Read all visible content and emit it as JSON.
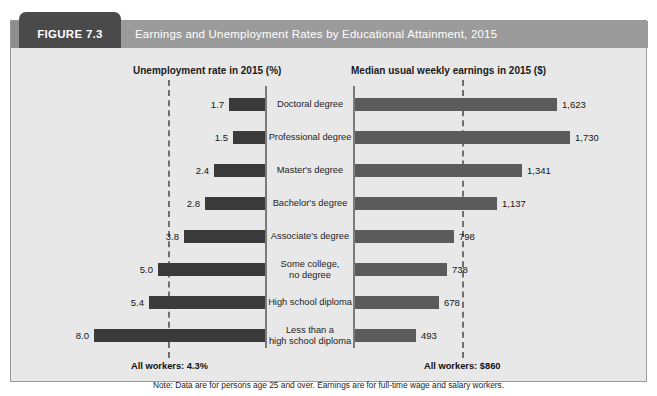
{
  "figure": {
    "tab_label": "FIGURE 7.3",
    "title": "Earnings and Unemployment Rates by Educational Attainment, 2015",
    "note": "Note: Data are for persons age 25 and over. Earnings are for full-time wage and salary workers.",
    "all_workers_unemployment": "All workers: 4.3%",
    "all_workers_earnings": "All workers: $860"
  },
  "colors": {
    "header_tab": "#4a4a4a",
    "header_bar": "#9b9b9b",
    "panel_background": "#e8e8e8",
    "unemployment_bar": "#3a3a3a",
    "earnings_bar": "#5b5b5b",
    "axis": "#7b7b7b",
    "reference_line": "#6f6f6f"
  },
  "chart_data": {
    "type": "bar",
    "title": "Earnings and Unemployment Rates by Educational Attainment, 2015",
    "orientation": "horizontal",
    "layout": "paired-back-to-back",
    "categories": [
      "Doctoral degree",
      "Professional degree",
      "Master's degree",
      "Bachelor's degree",
      "Associate's degree",
      "Some college,\nno degree",
      "High school diploma",
      "Less than a\nhigh school diploma"
    ],
    "category_lines": [
      [
        "Doctoral degree"
      ],
      [
        "Professional degree"
      ],
      [
        "Master's degree"
      ],
      [
        "Bachelor's degree"
      ],
      [
        "Associate's degree"
      ],
      [
        "Some college,",
        "no degree"
      ],
      [
        "High school diploma"
      ],
      [
        "Less than a",
        "high school diploma"
      ]
    ],
    "series": [
      {
        "name": "Unemployment rate in 2015 (%)",
        "axis": "left",
        "direction": "right-to-left",
        "unit": "%",
        "values": [
          1.7,
          1.5,
          2.4,
          2.8,
          3.8,
          5.0,
          5.4,
          8.0
        ],
        "labels": [
          "1.7",
          "1.5",
          "2.4",
          "2.8",
          "3.8",
          "5.0",
          "5.4",
          "8.0"
        ],
        "reference_value": 4.3,
        "reference_label": "All workers: 4.3%",
        "axis_max": 8.0,
        "grid": false
      },
      {
        "name": "Median usual weekly earnings in 2015 ($)",
        "axis": "right",
        "direction": "left-to-right",
        "unit": "$",
        "values": [
          1623,
          1730,
          1341,
          1137,
          798,
          738,
          678,
          493
        ],
        "labels": [
          "1,623",
          "1,730",
          "1,341",
          "1,137",
          "798",
          "738",
          "678",
          "493"
        ],
        "reference_value": 860,
        "reference_label": "All workers: $860",
        "axis_max": 1730,
        "grid": false
      }
    ],
    "xlabel": "",
    "ylabel": "",
    "legend": "none",
    "annotations": [
      "All workers: 4.3%",
      "All workers: $860",
      "Note: Data are for persons age 25 and over. Earnings are for full-time wage and salary workers."
    ]
  }
}
